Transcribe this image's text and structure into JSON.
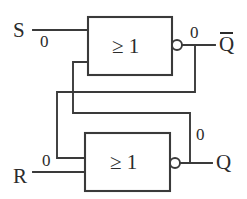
{
  "diagram": {
    "type": "logic-circuit-schematic",
    "stroke_color": "#3a3a3a",
    "text_color": "#2b2b2b",
    "background_color": "#ffffff"
  },
  "gates": [
    {
      "id": "nor-top",
      "symbol": "≥ 1",
      "function": "NOR",
      "inverted_output": true
    },
    {
      "id": "nor-bottom",
      "symbol": "≥ 1",
      "function": "NOR",
      "inverted_output": true
    }
  ],
  "inputs": [
    {
      "id": "S",
      "label": "S",
      "value": "0"
    },
    {
      "id": "R",
      "label": "R",
      "value": "0"
    }
  ],
  "outputs": [
    {
      "id": "Qbar",
      "label": "Q",
      "overline": true,
      "value": "0"
    },
    {
      "id": "Q",
      "label": "Q",
      "overline": false,
      "value": "0"
    }
  ]
}
